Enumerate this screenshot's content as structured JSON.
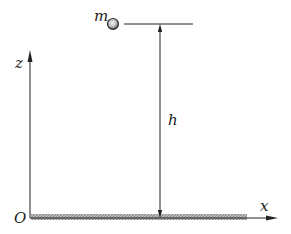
{
  "diagram": {
    "labels": {
      "mass": "m",
      "height": "h",
      "z_axis": "z",
      "x_axis": "x",
      "origin": "O"
    },
    "colors": {
      "line": "#222222",
      "ground_fill": "#999999",
      "ball_outer": "#333333",
      "ball_inner": "#e8e8e8"
    }
  }
}
